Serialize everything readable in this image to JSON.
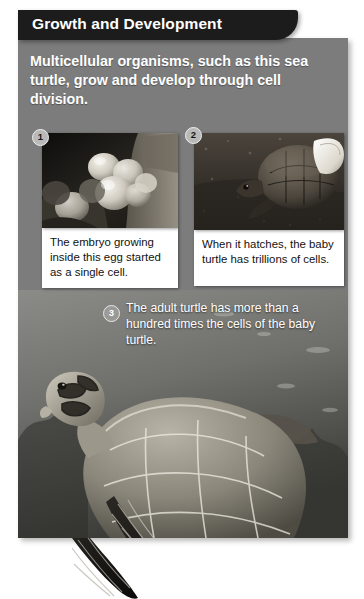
{
  "figure": {
    "header_title": "Growth and Development",
    "intro_text": "Multicellular organisms, such as this sea turtle, grow and develop through cell division.",
    "steps": [
      {
        "number": "1",
        "photo_alt": "sea-turtle-eggs-photo",
        "caption": "The embryo growing inside this egg started as a single cell."
      },
      {
        "number": "2",
        "photo_alt": "hatchling-turtle-photo",
        "caption": "When it hatches, the baby turtle has trillions of cells."
      },
      {
        "number": "3",
        "photo_alt": "adult-sea-turtle-swimming-photo",
        "caption": "The adult turtle has more than a hundred times the cells of the baby turtle."
      }
    ]
  },
  "colors": {
    "header_bar": "#1c1c1c",
    "panel_background": "#7c7c7c",
    "caption_background": "#ffffff",
    "header_text": "#ffffff",
    "body_text": "#111111"
  }
}
